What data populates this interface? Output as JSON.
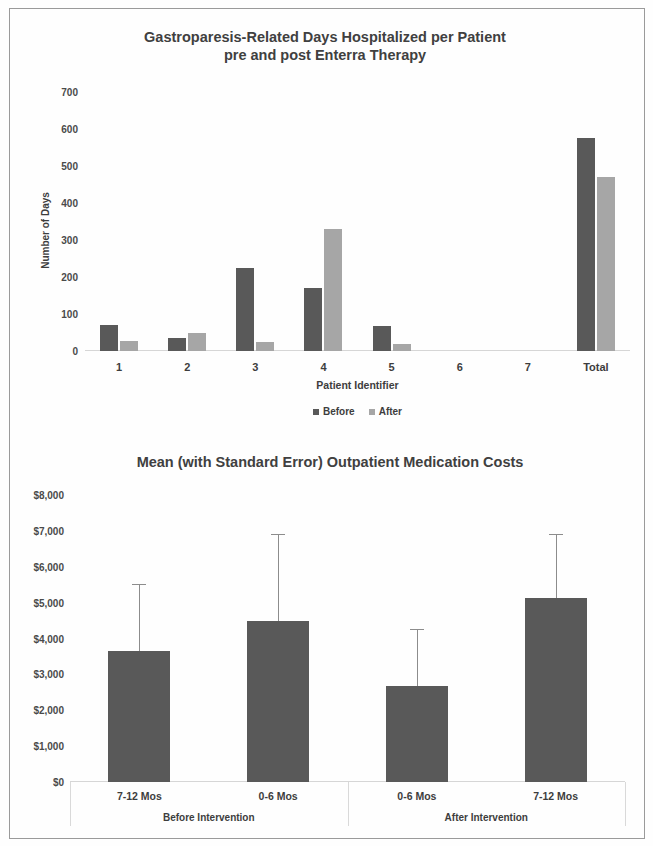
{
  "page": {
    "background_color": "#fefefe",
    "frame_color": "#9a9a9a"
  },
  "colors": {
    "before_bar": "#595959",
    "after_bar": "#a6a6a6",
    "cost_bar": "#595959",
    "error_bar": "#8c8c8c",
    "axis_line": "#d6d6d6",
    "text": "#3d3d3d"
  },
  "chart_data": [
    {
      "id": "hospital-days-chart",
      "type": "bar",
      "title": "Gastroparesis-Related Days Hospitalized per Patient pre and post Enterra Therapy",
      "title_line1": "Gastroparesis-Related Days Hospitalized per Patient",
      "title_line2": "pre and post Enterra Therapy",
      "xlabel": "Patient Identifier",
      "ylabel": "Number of Days",
      "ylim": [
        0,
        700
      ],
      "ytick_values": [
        0,
        100,
        200,
        300,
        400,
        500,
        600,
        700
      ],
      "ytick_labels": [
        "0",
        "100",
        "200",
        "300",
        "400",
        "500",
        "600",
        "700"
      ],
      "grid": false,
      "legend_position": "bottom",
      "categories": [
        "1",
        "2",
        "3",
        "4",
        "5",
        "6",
        "7",
        "Total"
      ],
      "series": [
        {
          "name": "Before",
          "color": "#595959",
          "values": [
            70,
            35,
            225,
            170,
            68,
            0,
            0,
            575
          ]
        },
        {
          "name": "After",
          "color": "#a6a6a6",
          "values": [
            28,
            48,
            25,
            330,
            18,
            0,
            0,
            470
          ]
        }
      ]
    },
    {
      "id": "medication-costs-chart",
      "type": "bar",
      "title": "Mean (with Standard Error) Outpatient Medication Costs",
      "xlabel": "",
      "ylabel": "",
      "ylim": [
        0,
        8000
      ],
      "ytick_values": [
        0,
        1000,
        2000,
        3000,
        4000,
        5000,
        6000,
        7000,
        8000
      ],
      "ytick_labels": [
        "$0",
        "$1,000",
        "$2,000",
        "$3,000",
        "$4,000",
        "$5,000",
        "$6,000",
        "$7,000",
        "$8,000"
      ],
      "grid": false,
      "legend_position": "none",
      "categories": [
        "7-12 Mos",
        "0-6 Mos",
        "0-6 Mos",
        "7-12 Mos"
      ],
      "group_labels": [
        "Before Intervention",
        "After Intervention"
      ],
      "groups": [
        {
          "label": "Before Intervention",
          "category_indices": [
            0,
            1
          ]
        },
        {
          "label": "After Intervention",
          "category_indices": [
            2,
            3
          ]
        }
      ],
      "series": [
        {
          "name": "Mean Outpatient Medication Cost",
          "color": "#595959",
          "values": [
            3650,
            4490,
            2680,
            5130
          ],
          "error_high": [
            5520,
            6920,
            4260,
            6920
          ]
        }
      ]
    }
  ]
}
